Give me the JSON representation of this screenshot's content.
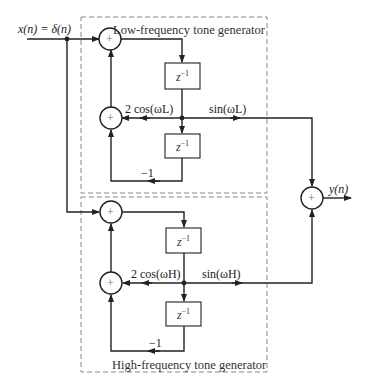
{
  "diagram": {
    "input_label": "x(n) = δ(n)",
    "output_label": "y(n)",
    "low": {
      "title": "Low-frequency tone generator",
      "coef_label": "2 cos(ωL)",
      "sin_label": "sin(ωL)",
      "minus_one": "−1",
      "delay_base": "z",
      "delay_exp": "−1"
    },
    "high": {
      "title": "High-frequency tone generator",
      "coef_label": "2 cos(ωH)",
      "sin_label": "sin(ωH)",
      "minus_one": "−1",
      "delay_base": "z",
      "delay_exp": "−1"
    },
    "adder_symbol": "+"
  }
}
